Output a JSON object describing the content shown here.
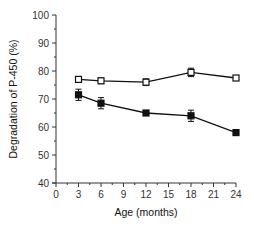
{
  "chart_data": {
    "type": "line",
    "title": "",
    "xlabel": "Age (months)",
    "ylabel": "Degradation of P-450 (%)",
    "x": [
      3,
      6,
      12,
      18,
      24
    ],
    "xticks": [
      0,
      3,
      6,
      9,
      12,
      15,
      18,
      21,
      24
    ],
    "yticks": [
      40,
      50,
      60,
      70,
      80,
      90,
      100
    ],
    "xlim": [
      0,
      24
    ],
    "ylim": [
      40,
      100
    ],
    "grid": false,
    "legend": "none",
    "series": [
      {
        "name": "open squares",
        "marker": "open-square",
        "values": [
          77,
          76.5,
          76,
          79.5,
          77.5
        ],
        "errors": [
          1,
          1,
          1.2,
          1.5,
          0.8
        ]
      },
      {
        "name": "filled squares",
        "marker": "filled-square",
        "values": [
          71.5,
          68.5,
          65,
          64,
          58
        ],
        "errors": [
          2,
          2,
          0.8,
          2,
          0.8
        ]
      }
    ],
    "colors": {
      "line": "#111111",
      "axis": "#333333"
    }
  }
}
